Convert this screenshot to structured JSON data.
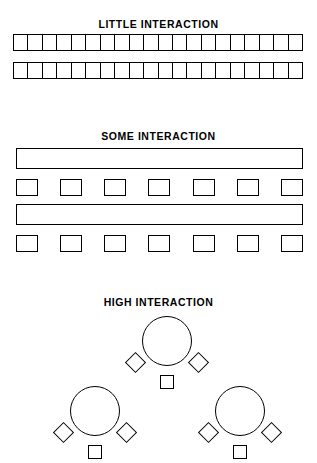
{
  "figure": {
    "background_color": "#ffffff",
    "stroke_color": "#000000"
  },
  "sections": [
    {
      "id": "little-interaction",
      "title": "LITTLE INTERACTION",
      "layout_type": "rows-of-joined-desks",
      "rows": 2,
      "cells_per_row": 20,
      "shapes": [
        "rectangle"
      ]
    },
    {
      "id": "some-interaction",
      "title": "SOME INTERACTION",
      "layout_type": "long-table-with-seats",
      "groups": 2,
      "seats_per_group": 7,
      "shapes": [
        "long-bar",
        "square"
      ]
    },
    {
      "id": "high-interaction",
      "title": "HIGH INTERACTION",
      "layout_type": "round-table-clusters",
      "clusters": 3,
      "seats_per_cluster": 3,
      "shapes": [
        "circle",
        "diamond",
        "square"
      ]
    }
  ],
  "little": {
    "title": "LITTLE INTERACTION",
    "row_cells": [
      [
        "1",
        "2",
        "3",
        "4",
        "5",
        "6",
        "7",
        "8",
        "9",
        "10",
        "11",
        "12",
        "13",
        "14",
        "15",
        "16",
        "17",
        "18",
        "19",
        "20"
      ],
      [
        "1",
        "2",
        "3",
        "4",
        "5",
        "6",
        "7",
        "8",
        "9",
        "10",
        "11",
        "12",
        "13",
        "14",
        "15",
        "16",
        "17",
        "18",
        "19",
        "20"
      ]
    ]
  },
  "some": {
    "title": "SOME INTERACTION",
    "groups": [
      {
        "seats": [
          "1",
          "2",
          "3",
          "4",
          "5",
          "6",
          "7"
        ]
      },
      {
        "seats": [
          "1",
          "2",
          "3",
          "4",
          "5",
          "6",
          "7"
        ]
      }
    ]
  },
  "high": {
    "title": "HIGH INTERACTION",
    "clusters": [
      {
        "position": "top",
        "seats": [
          "left-diamond",
          "right-diamond",
          "center-square"
        ]
      },
      {
        "position": "bottom-left",
        "seats": [
          "left-diamond",
          "right-diamond",
          "center-square"
        ]
      },
      {
        "position": "bottom-right",
        "seats": [
          "left-diamond",
          "right-diamond",
          "center-square"
        ]
      }
    ]
  }
}
